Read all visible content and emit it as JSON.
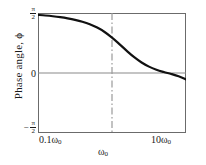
{
  "chart_data": {
    "type": "line",
    "title": "",
    "xlabel": "",
    "ylabel": "Phase angle, ϕ",
    "xscale": "log",
    "xlim": [
      0.1,
      10.0
    ],
    "ylim": [
      -1.5707963,
      1.5707963
    ],
    "xtick_labels": [
      "0.1ω₀",
      "ω₀",
      "10ω₀"
    ],
    "xticks": [
      0.1,
      1.0,
      10.0
    ],
    "ytick_labels": [
      "π/2",
      "0",
      "−π/2"
    ],
    "yticks": [
      1.5707963,
      0.0,
      -1.5707963
    ],
    "grid": false,
    "legend": null,
    "reference_lines": [
      {
        "name": "zero-phase-line",
        "orientation": "horizontal",
        "value": 0.0,
        "style": "solid",
        "color": "#8a8a8a"
      },
      {
        "name": "resonance-line",
        "orientation": "vertical",
        "value": 1.0,
        "style": "dash-dot",
        "color": "#9a9a9a"
      }
    ],
    "series": [
      {
        "name": "phase",
        "color": "#111111",
        "width": 2.2,
        "x": [
          0.1,
          0.1259,
          0.1585,
          0.1995,
          0.2512,
          0.3162,
          0.3981,
          0.5012,
          0.631,
          0.7943,
          1.0,
          1.2589,
          1.5849,
          1.9953,
          2.5119,
          3.1623,
          3.9811,
          5.0119,
          6.3096,
          7.9433,
          10.0
        ],
        "y": [
          1.5207,
          1.5052,
          1.4857,
          1.4614,
          1.4307,
          1.3917,
          1.3414,
          1.2757,
          1.1889,
          1.0735,
          0.9273,
          0.7571,
          0.5791,
          0.4139,
          0.2749,
          0.1668,
          0.0867,
          0.0262,
          -0.0262,
          -0.0867,
          -0.1668
        ],
        "note": "phi = arctan2 symmetric sweep from +pi/2 to -pi/2 about omega_0"
      }
    ],
    "axis_labels": {
      "y_top": {
        "prefix": "",
        "numerator": "π",
        "denominator": "2"
      },
      "y_mid": "0",
      "y_bottom": {
        "prefix": "−",
        "numerator": "π",
        "denominator": "2"
      },
      "x_left": {
        "coefficient": "0.1",
        "symbol": "ω",
        "subscript": "0"
      },
      "x_center": {
        "coefficient": "",
        "symbol": "ω",
        "subscript": "0"
      },
      "x_right": {
        "coefficient": "10",
        "symbol": "ω",
        "subscript": "0"
      }
    }
  },
  "figure": {
    "ylabel": "Phase angle, ϕ",
    "y_top_num": "π",
    "y_top_den": "2",
    "y_mid": "0",
    "y_bot_minus": "−",
    "y_bot_num": "π",
    "y_bot_den": "2",
    "x_left_coeff": "0.1",
    "x_left_sym": "ω",
    "x_left_sub": "0",
    "x_center_sym": "ω",
    "x_center_sub": "0",
    "x_right_coeff": "10",
    "x_right_sym": "ω",
    "x_right_sub": "0"
  }
}
